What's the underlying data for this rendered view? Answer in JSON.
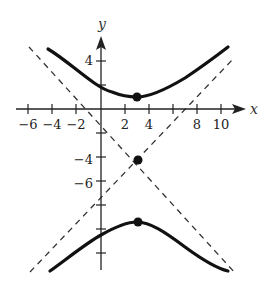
{
  "figure": {
    "axes": {
      "x_label": "x",
      "y_label": "y",
      "x_ticks": [
        {
          "value": -6,
          "label": "−6"
        },
        {
          "value": -4,
          "label": "−4"
        },
        {
          "value": -2,
          "label": "−2"
        },
        {
          "value": 2,
          "label": "2"
        },
        {
          "value": 4,
          "label": "4"
        },
        {
          "value": 8,
          "label": "8"
        },
        {
          "value": 10,
          "label": "10"
        }
      ],
      "y_ticks": [
        {
          "value": 4,
          "label": "4"
        },
        {
          "value": -4,
          "label": "−4"
        },
        {
          "value": -6,
          "label": "−6"
        }
      ]
    },
    "center": [
      3,
      -4
    ],
    "vertices": [
      [
        3,
        1
      ],
      [
        3,
        -9
      ]
    ],
    "colors": {
      "curve": "#111111",
      "asymptote": "#333333",
      "axis": "#222222"
    }
  }
}
